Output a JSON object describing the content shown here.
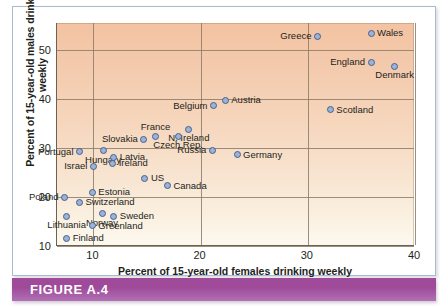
{
  "figure": {
    "caption": "FIGURE A.4"
  },
  "chart_data": {
    "type": "scatter",
    "title": "",
    "xlabel": "Percent of 15-year-old females drinking weekly",
    "ylabel": "Percent of 15-year-old males drinking weekly",
    "xlim": [
      6.6,
      40
    ],
    "ylim": [
      10,
      55.5
    ],
    "xticks": [
      10,
      20,
      30,
      40
    ],
    "yticks": [
      10,
      20,
      30,
      40,
      50
    ],
    "grid": true,
    "legend": "none",
    "marker_fill": "#9db3d6",
    "marker_edge": "#44618f",
    "plot_bg_top": "#f3c3a2",
    "plot_bg_bottom": "#fdf8ef",
    "points": [
      {
        "label": "Wales",
        "x": 35.9,
        "y": 53.4,
        "pos": "right"
      },
      {
        "label": "Greece",
        "x": 30.9,
        "y": 52.8,
        "pos": "left"
      },
      {
        "label": "England",
        "x": 35.9,
        "y": 47.5,
        "pos": "left"
      },
      {
        "label": "Denmark",
        "x": 38.1,
        "y": 46.7,
        "pos": "below"
      },
      {
        "label": "Austria",
        "x": 22.3,
        "y": 39.7,
        "pos": "right"
      },
      {
        "label": "Belgium",
        "x": 21.2,
        "y": 38.6,
        "pos": "left"
      },
      {
        "label": "Scotland",
        "x": 32.1,
        "y": 37.8,
        "pos": "right"
      },
      {
        "label": "N. Ireland",
        "x": 18.9,
        "y": 33.8,
        "pos": "below"
      },
      {
        "label": "Czech Rep.",
        "x": 17.9,
        "y": 32.4,
        "pos": "below"
      },
      {
        "label": "France",
        "x": 15.8,
        "y": 32.4,
        "pos": "above"
      },
      {
        "label": "Slovakia",
        "x": 14.7,
        "y": 31.8,
        "pos": "left"
      },
      {
        "label": "Russia",
        "x": 21.1,
        "y": 29.5,
        "pos": "left"
      },
      {
        "label": "Hungary",
        "x": 10.9,
        "y": 29.4,
        "pos": "below"
      },
      {
        "label": "Portugal",
        "x": 8.7,
        "y": 29.2,
        "pos": "left"
      },
      {
        "label": "Germany",
        "x": 23.4,
        "y": 28.6,
        "pos": "right"
      },
      {
        "label": "Latvia",
        "x": 11.9,
        "y": 28.1,
        "pos": "right"
      },
      {
        "label": "Ireland",
        "x": 11.8,
        "y": 26.9,
        "pos": "right"
      },
      {
        "label": "Israel",
        "x": 10.0,
        "y": 26.3,
        "pos": "left"
      },
      {
        "label": "US",
        "x": 14.8,
        "y": 23.8,
        "pos": "right"
      },
      {
        "label": "Canada",
        "x": 16.9,
        "y": 22.3,
        "pos": "right"
      },
      {
        "label": "Estonia",
        "x": 9.9,
        "y": 21.0,
        "pos": "right"
      },
      {
        "label": "Poland",
        "x": 7.3,
        "y": 19.9,
        "pos": "left"
      },
      {
        "label": "Switzerland",
        "x": 8.7,
        "y": 18.9,
        "pos": "right"
      },
      {
        "label": "Norway",
        "x": 10.8,
        "y": 16.6,
        "pos": "below"
      },
      {
        "label": "Sweden",
        "x": 11.9,
        "y": 16.1,
        "pos": "right"
      },
      {
        "label": "Lithuania",
        "x": 7.5,
        "y": 16.1,
        "pos": "below"
      },
      {
        "label": "Greenland",
        "x": 9.9,
        "y": 14.1,
        "pos": "right"
      },
      {
        "label": "Finland",
        "x": 7.5,
        "y": 11.6,
        "pos": "right"
      }
    ]
  }
}
